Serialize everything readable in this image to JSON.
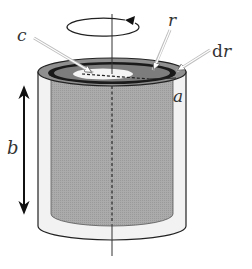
{
  "figure": {
    "labels": {
      "c": "c",
      "r": "r",
      "dr_prefix": "d",
      "dr_var": "r",
      "a": "a",
      "b": "b"
    },
    "colors": {
      "background": "#ffffff",
      "outer_wall": "#f2f2f2",
      "inner_fill": "#a9a9a9",
      "top_annulus": "#8f8f8f",
      "shell_ring": "#1a1a1a",
      "inner_disk": "#f4f4f4",
      "stroke": "#222222",
      "pointer_arrow": "#bdbdbd"
    },
    "annotations": {
      "rotation": "counterclockwise rotation arrow about vertical axis",
      "height_arrow": "double-headed arrow indicating height b",
      "axis": "vertical axis of rotation (dashed inside cylinder)"
    }
  }
}
